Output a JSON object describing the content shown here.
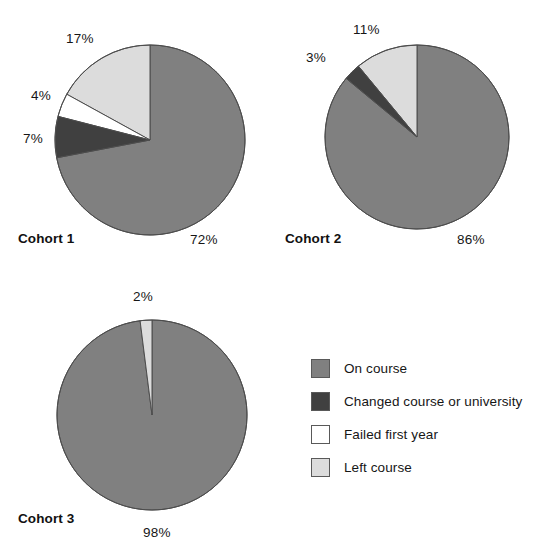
{
  "chart_data": {
    "type": "pie",
    "title": "",
    "subtitle": "",
    "xlabel": "",
    "ylabel": "",
    "grid": false,
    "legend_position": "bottom-right",
    "start_angle_deg": 90,
    "direction": "counterclockwise",
    "categories": [
      "On course",
      "Changed course or university",
      "Failed first year",
      "Left course"
    ],
    "colors": {
      "on_course": "#808080",
      "changed_course": "#404040",
      "failed_first_year": "#ffffff",
      "left_course": "#dcdcdc",
      "outline": "#4d4d4d",
      "background": "#ffffff",
      "text": "#161616"
    },
    "series": [
      {
        "name": "Cohort 1",
        "values": [
          72,
          7,
          4,
          17
        ],
        "labels": [
          "72%",
          "7%",
          "4%",
          "17%"
        ]
      },
      {
        "name": "Cohort 2",
        "values": [
          86,
          3,
          0,
          11
        ],
        "labels": [
          "86%",
          "3%",
          "",
          "11%"
        ]
      },
      {
        "name": "Cohort 3",
        "values": [
          98,
          0,
          0,
          2
        ],
        "labels": [
          "98%",
          "",
          "",
          "2%"
        ]
      }
    ]
  },
  "pies": [
    {
      "name": "Cohort 1",
      "cohort_label": "Cohort 1",
      "cx": 150,
      "cy": 140,
      "r": 95,
      "slices": [
        {
          "key": "on_course",
          "value": 72,
          "label": "72%"
        },
        {
          "key": "left_course",
          "value": 17,
          "label": "17%"
        },
        {
          "key": "failed_first_year",
          "value": 4,
          "label": "4%"
        },
        {
          "key": "changed_course",
          "value": 7,
          "label": "7%"
        }
      ],
      "pct_labels": [
        {
          "text": "17%",
          "x": 66,
          "y": 31
        },
        {
          "text": "4%",
          "x": 31,
          "y": 88
        },
        {
          "text": "7%",
          "x": 23,
          "y": 131
        },
        {
          "text": "72%",
          "x": 190,
          "y": 232
        }
      ],
      "cohort_label_pos": {
        "x": 18,
        "y": 231
      }
    },
    {
      "name": "Cohort 2",
      "cohort_label": "Cohort 2",
      "cx": 417,
      "cy": 137,
      "r": 92,
      "slices": [
        {
          "key": "on_course",
          "value": 86,
          "label": "86%"
        },
        {
          "key": "left_course",
          "value": 11,
          "label": "11%"
        },
        {
          "key": "changed_course",
          "value": 3,
          "label": "3%"
        }
      ],
      "pct_labels": [
        {
          "text": "11%",
          "x": 353,
          "y": 22
        },
        {
          "text": "3%",
          "x": 306,
          "y": 50
        },
        {
          "text": "86%",
          "x": 457,
          "y": 232
        }
      ],
      "cohort_label_pos": {
        "x": 285,
        "y": 231
      }
    },
    {
      "name": "Cohort 3",
      "cohort_label": "Cohort 3",
      "cx": 152,
      "cy": 415,
      "r": 95,
      "slices": [
        {
          "key": "on_course",
          "value": 98,
          "label": "98%"
        },
        {
          "key": "left_course",
          "value": 2,
          "label": "2%"
        }
      ],
      "pct_labels": [
        {
          "text": "2%",
          "x": 133,
          "y": 289
        },
        {
          "text": "98%",
          "x": 143,
          "y": 525
        }
      ],
      "cohort_label_pos": {
        "x": 18,
        "y": 511
      }
    }
  ],
  "legend": {
    "items": [
      {
        "label": "On course",
        "key": "on_course"
      },
      {
        "label": "Changed course or university",
        "key": "changed_course"
      },
      {
        "label": "Failed first year",
        "key": "failed_first_year"
      },
      {
        "label": "Left course",
        "key": "left_course"
      }
    ]
  }
}
